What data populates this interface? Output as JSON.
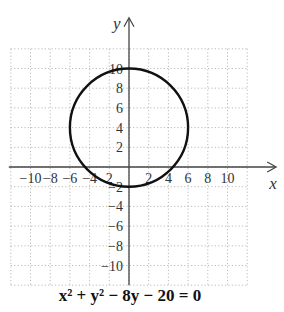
{
  "chart_data": {
    "type": "line",
    "title": "",
    "equation": "x² + y² − 8y − 20 = 0",
    "xlabel": "x",
    "ylabel": "y",
    "xlim": [
      -12,
      12
    ],
    "ylim": [
      -12,
      12
    ],
    "grid": true,
    "x_ticks": [
      -10,
      -8,
      -6,
      -4,
      -2,
      2,
      4,
      6,
      8,
      10
    ],
    "y_ticks": [
      10,
      8,
      6,
      4,
      2,
      -2,
      -4,
      -6,
      -8,
      -10
    ],
    "x_tick_labels": [
      "−10",
      "−8",
      "−6",
      "−4",
      "2",
      "2",
      "4",
      "6",
      "8",
      "10"
    ],
    "y_tick_labels": [
      "10",
      "8",
      "6",
      "4",
      "2",
      "−2",
      "−4",
      "−6",
      "−8",
      "−10"
    ],
    "series": [
      {
        "name": "circle",
        "shape": "circle",
        "center": [
          0,
          4
        ],
        "radius": 6
      }
    ]
  },
  "caption": {
    "equation": "x² + y² − 8y − 20 = 0"
  }
}
